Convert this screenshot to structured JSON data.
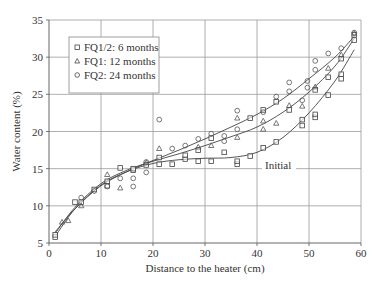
{
  "chart_data": {
    "type": "scatter",
    "title": "",
    "xlabel": "Distance to the heater (cm)",
    "ylabel": "Water content (%)",
    "xlim": [
      0,
      60
    ],
    "ylim": [
      5,
      35
    ],
    "xticks": [
      0,
      10,
      20,
      30,
      40,
      50,
      60
    ],
    "yticks": [
      5,
      10,
      15,
      20,
      25,
      30,
      35
    ],
    "grid": true,
    "legend_position": "top-left",
    "annotations": [
      {
        "text": "Initial",
        "x": 42.5,
        "y": 15.3
      }
    ],
    "series": [
      {
        "name": "FQ1/2: 6 months",
        "marker": "square",
        "points": [
          [
            1.2,
            5.8
          ],
          [
            1.2,
            6.1
          ],
          [
            5,
            10.5
          ],
          [
            6.2,
            10.5
          ],
          [
            8.7,
            12.2
          ],
          [
            11.2,
            12.7
          ],
          [
            11.2,
            13.3
          ],
          [
            13.7,
            15.1
          ],
          [
            16.2,
            14.8
          ],
          [
            16.2,
            15
          ],
          [
            18.7,
            15.5
          ],
          [
            21.2,
            15.6
          ],
          [
            21.2,
            16.5
          ],
          [
            23.7,
            15.6
          ],
          [
            26.2,
            16.3
          ],
          [
            26.2,
            16.8
          ],
          [
            28.7,
            16
          ],
          [
            28.7,
            17.5
          ],
          [
            31.2,
            16
          ],
          [
            31.2,
            19.1
          ],
          [
            33.7,
            17.2
          ],
          [
            36.2,
            15.6
          ],
          [
            36.2,
            16
          ],
          [
            38.7,
            16.7
          ],
          [
            38.7,
            21.8
          ],
          [
            41.2,
            17.8
          ],
          [
            41.2,
            22.9
          ],
          [
            43.7,
            18.6
          ],
          [
            43.7,
            24
          ],
          [
            46.2,
            22.9
          ],
          [
            48.7,
            20.8
          ],
          [
            48.7,
            21.6
          ],
          [
            51.2,
            21.9
          ],
          [
            51.2,
            22.3
          ],
          [
            51.2,
            25.6
          ],
          [
            53.7,
            24.9
          ],
          [
            53.7,
            27.3
          ],
          [
            56.2,
            27.1
          ],
          [
            56.2,
            27.7
          ],
          [
            56.2,
            29.8
          ],
          [
            58.7,
            32.3
          ],
          [
            58.7,
            33
          ]
        ]
      },
      {
        "name": "FQ1: 12 months",
        "marker": "triangle",
        "points": [
          [
            2.5,
            7.8
          ],
          [
            3.7,
            8
          ],
          [
            6.2,
            10
          ],
          [
            11.2,
            14.2
          ],
          [
            13.7,
            12.4
          ],
          [
            18.7,
            15.8
          ],
          [
            21.2,
            17.7
          ],
          [
            28.7,
            17.9
          ],
          [
            31.2,
            18.1
          ],
          [
            36.2,
            21.8
          ],
          [
            36.2,
            19.2
          ],
          [
            41.2,
            21.4
          ],
          [
            41.2,
            20.3
          ],
          [
            43.7,
            21.1
          ],
          [
            46.2,
            23.5
          ],
          [
            48.7,
            23.4
          ],
          [
            51.2,
            26
          ],
          [
            53.7,
            28.5
          ],
          [
            56.2,
            30.3
          ],
          [
            58.7,
            33.2
          ]
        ]
      },
      {
        "name": "FQ2: 24 months",
        "marker": "circle",
        "points": [
          [
            6.2,
            11.1
          ],
          [
            8.7,
            12
          ],
          [
            11.2,
            12.6
          ],
          [
            13.7,
            13.7
          ],
          [
            16.2,
            12.6
          ],
          [
            16.2,
            13.7
          ],
          [
            18.7,
            14.5
          ],
          [
            18.7,
            15.9
          ],
          [
            21.2,
            21.6
          ],
          [
            23.7,
            17.7
          ],
          [
            26.2,
            18.1
          ],
          [
            28.7,
            19
          ],
          [
            31.2,
            19.7
          ],
          [
            33.7,
            19.4
          ],
          [
            33.7,
            18.7
          ],
          [
            36.2,
            22.8
          ],
          [
            36.2,
            20.3
          ],
          [
            41.2,
            22.6
          ],
          [
            43.7,
            24.7
          ],
          [
            46.2,
            26.6
          ],
          [
            46.2,
            25.4
          ],
          [
            48.7,
            24.2
          ],
          [
            49.7,
            26.8
          ],
          [
            49.7,
            25.9
          ],
          [
            51.2,
            29.5
          ],
          [
            51.2,
            28.3
          ],
          [
            53.7,
            30.5
          ],
          [
            56.2,
            31.2
          ],
          [
            58.7,
            33.3
          ]
        ]
      }
    ],
    "fit_curves": [
      {
        "name": "initial",
        "points": [
          [
            1.2,
            5.9
          ],
          [
            5,
            9.6
          ],
          [
            10,
            12.8
          ],
          [
            15,
            14.6
          ],
          [
            20,
            15.7
          ],
          [
            25,
            16.2
          ],
          [
            30,
            16.4
          ],
          [
            35,
            16.5
          ],
          [
            40,
            17.2
          ],
          [
            45,
            19.2
          ],
          [
            50,
            22.5
          ],
          [
            55,
            26.8
          ],
          [
            58.7,
            31
          ]
        ]
      },
      {
        "name": "12 months",
        "points": [
          [
            1.2,
            6.3
          ],
          [
            5,
            9.8
          ],
          [
            10,
            13
          ],
          [
            15,
            14.8
          ],
          [
            20,
            16
          ],
          [
            25,
            17
          ],
          [
            30,
            18.1
          ],
          [
            35,
            19.3
          ],
          [
            40,
            20.6
          ],
          [
            45,
            22.6
          ],
          [
            50,
            25.3
          ],
          [
            55,
            28.8
          ],
          [
            58.7,
            32.5
          ]
        ]
      },
      {
        "name": "24 months",
        "points": [
          [
            1.2,
            6.5
          ],
          [
            5,
            9.6
          ],
          [
            10,
            12.7
          ],
          [
            15,
            14.6
          ],
          [
            20,
            16.1
          ],
          [
            25,
            17.5
          ],
          [
            30,
            19
          ],
          [
            35,
            20.6
          ],
          [
            40,
            22.3
          ],
          [
            45,
            24.4
          ],
          [
            50,
            27.1
          ],
          [
            55,
            30
          ],
          [
            58.7,
            32.8
          ]
        ]
      }
    ]
  }
}
